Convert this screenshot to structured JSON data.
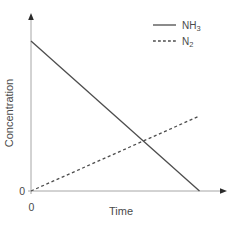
{
  "colors": {
    "background": "#ffffff",
    "line": "#4d4d4d",
    "axis": "#a6a6a6",
    "arrow": "#2b2b2b",
    "text": "#4a4a4a"
  },
  "chart_data": {
    "type": "line",
    "title": "",
    "xlabel": "Time",
    "ylabel": "Concentration",
    "x_origin_label": "0",
    "y_origin_label": "0",
    "xlim": [
      0,
      1.16
    ],
    "ylim": [
      0,
      1.18
    ],
    "grid": false,
    "legend_position": "top-right",
    "series": [
      {
        "name": "NH3",
        "display_base": "NH",
        "display_sub": "3",
        "line_style": "solid",
        "color": "#4d4d4d",
        "x": [
          0,
          1
        ],
        "y": [
          1.0,
          0.0
        ]
      },
      {
        "name": "N2",
        "display_base": "N",
        "display_sub": "2",
        "line_style": "dashed",
        "color": "#4d4d4d",
        "x": [
          0,
          1
        ],
        "y": [
          0.0,
          0.5
        ]
      }
    ]
  }
}
